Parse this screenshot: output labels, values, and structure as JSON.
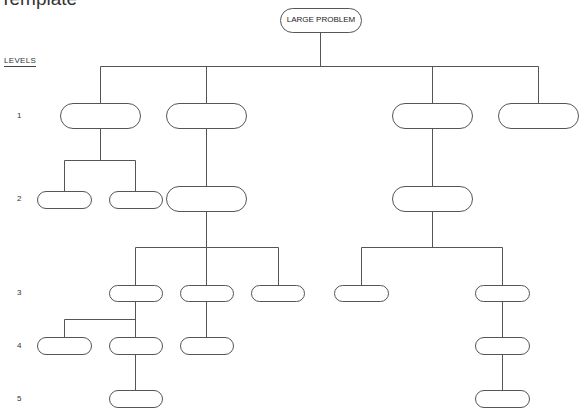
{
  "page": {
    "title": "Template",
    "levels_heading": "LEVELS"
  },
  "diagram": {
    "root": {
      "label": "LARGE PROBLEM"
    },
    "levels": [
      {
        "label": "1",
        "y": 116
      },
      {
        "label": "2",
        "y": 199
      },
      {
        "label": "3",
        "y": 293
      },
      {
        "label": "4",
        "y": 346
      },
      {
        "label": "5",
        "y": 399
      }
    ],
    "nodes": [
      {
        "id": "L1-a",
        "level": 1,
        "label": ""
      },
      {
        "id": "L1-b",
        "level": 1,
        "label": ""
      },
      {
        "id": "L1-c",
        "level": 1,
        "label": ""
      },
      {
        "id": "L1-d",
        "level": 1,
        "label": ""
      },
      {
        "id": "L2-a",
        "level": 2,
        "label": ""
      },
      {
        "id": "L2-b",
        "level": 2,
        "label": ""
      },
      {
        "id": "L2-c",
        "level": 2,
        "label": ""
      },
      {
        "id": "L2-d",
        "level": 2,
        "label": ""
      },
      {
        "id": "L3-a",
        "level": 3,
        "label": ""
      },
      {
        "id": "L3-b",
        "level": 3,
        "label": ""
      },
      {
        "id": "L3-c",
        "level": 3,
        "label": ""
      },
      {
        "id": "L3-d",
        "level": 3,
        "label": ""
      },
      {
        "id": "L3-e",
        "level": 3,
        "label": ""
      },
      {
        "id": "L4-a",
        "level": 4,
        "label": ""
      },
      {
        "id": "L4-b",
        "level": 4,
        "label": ""
      },
      {
        "id": "L4-c",
        "level": 4,
        "label": ""
      },
      {
        "id": "L4-d",
        "level": 4,
        "label": ""
      },
      {
        "id": "L5-a",
        "level": 5,
        "label": ""
      },
      {
        "id": "L5-b",
        "level": 5,
        "label": ""
      }
    ],
    "colors": {
      "line": "#555555",
      "background": "#ffffff"
    }
  }
}
